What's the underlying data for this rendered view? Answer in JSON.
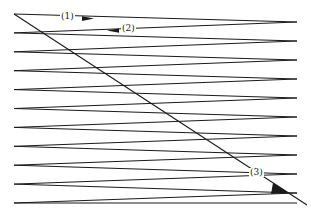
{
  "figure": {
    "title": "",
    "background_color": "#ffffff",
    "line_color": "#1a1a1a",
    "width": 311,
    "height": 215,
    "labels": [
      {
        "id": "1",
        "text": "(1)",
        "x": 60,
        "y": 12,
        "arrow": "right",
        "on": "upper-horizontal-segment"
      },
      {
        "id": "2",
        "text": "(2)",
        "x": 121,
        "y": 24,
        "arrow": "left",
        "on": "return-slanted-segment"
      },
      {
        "id": "3",
        "text": "(3)",
        "x": 249,
        "y": 168,
        "arrow": "down-right",
        "on": "diagonal-line"
      }
    ]
  },
  "chart_data": {
    "type": "line",
    "title": "",
    "xlabel": "",
    "ylabel": "",
    "grid": false,
    "legend": "none",
    "xlim": [
      0,
      311
    ],
    "ylim": [
      0,
      215
    ],
    "geometry": {
      "left_x": 14,
      "right_x": 297,
      "vertex_spacing": 18.9,
      "num_left_vertices": 11,
      "num_right_vertices": 10,
      "left_vertices_y": [
        14,
        32.9,
        51.8,
        70.7,
        89.6,
        108.5,
        127.4,
        146.3,
        165.2,
        184.1,
        203
      ],
      "right_vertices_y": [
        22,
        41,
        60,
        79,
        98,
        117,
        136,
        155,
        174,
        193
      ],
      "diagonal": {
        "x1": 14,
        "y1": 14,
        "x2": 307,
        "y2": 205
      }
    },
    "series": [
      {
        "name": "zigzag-scan-path",
        "points": [
          [
            14,
            14
          ],
          [
            297,
            22
          ],
          [
            14,
            32.9
          ],
          [
            297,
            41
          ],
          [
            14,
            51.8
          ],
          [
            297,
            60
          ],
          [
            14,
            70.7
          ],
          [
            297,
            79
          ],
          [
            14,
            89.6
          ],
          [
            297,
            98
          ],
          [
            14,
            108.5
          ],
          [
            297,
            117
          ],
          [
            14,
            127.4
          ],
          [
            297,
            136
          ],
          [
            14,
            146.3
          ],
          [
            297,
            155
          ],
          [
            14,
            165.2
          ],
          [
            297,
            174
          ],
          [
            14,
            184.1
          ],
          [
            297,
            193
          ],
          [
            14,
            203
          ],
          [
            297,
            203
          ]
        ]
      },
      {
        "name": "diagonal-line",
        "points": [
          [
            14,
            14
          ],
          [
            307,
            205
          ]
        ]
      }
    ]
  }
}
